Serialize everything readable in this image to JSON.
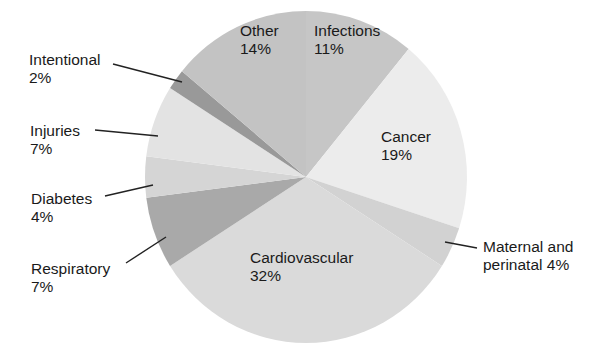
{
  "chart_data": {
    "type": "pie",
    "title": "",
    "start_angle_deg": 0,
    "direction": "clockwise",
    "slices": [
      {
        "label": "Infections",
        "value": 11,
        "display": "Infections\n11%",
        "color": "#c6c6c6"
      },
      {
        "label": "Cancer",
        "value": 19,
        "display": "Cancer\n19%",
        "color": "#ececec"
      },
      {
        "label": "Maternal and perinatal",
        "value": 4,
        "display": "Maternal and\nperinatal 4%",
        "color": "#d2d2d2"
      },
      {
        "label": "Cardiovascular",
        "value": 32,
        "display": "Cardiovascular\n32%",
        "color": "#dadada"
      },
      {
        "label": "Respiratory",
        "value": 7,
        "display": "Respiratory\n7%",
        "color": "#a9a9a9"
      },
      {
        "label": "Diabetes",
        "value": 4,
        "display": "Diabetes\n4%",
        "color": "#d5d5d5"
      },
      {
        "label": "Injuries",
        "value": 7,
        "display": "Injuries\n7%",
        "color": "#e3e3e3"
      },
      {
        "label": "Intentional",
        "value": 2,
        "display": "Intentional\n2%",
        "color": "#999999"
      },
      {
        "label": "Other",
        "value": 14,
        "display": "Other\n14%",
        "color": "#c3c3c3"
      }
    ]
  },
  "labels": {
    "infections": "Infections\n11%",
    "cancer": "Cancer\n19%",
    "maternal": "Maternal and\nperinatal 4%",
    "cardiovascular": "Cardiovascular\n32%",
    "respiratory": "Respiratory\n7%",
    "diabetes": "Diabetes\n4%",
    "injuries": "Injuries\n7%",
    "intentional": "Intentional\n2%",
    "other": "Other\n14%"
  }
}
